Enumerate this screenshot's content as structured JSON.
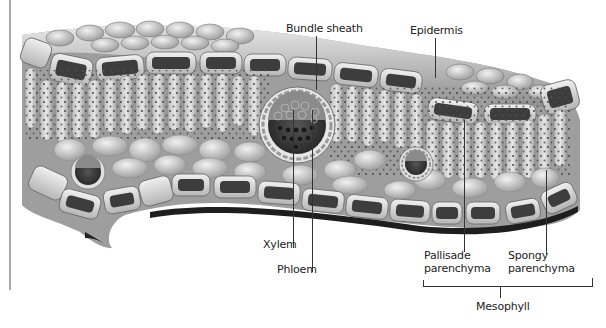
{
  "diagram": {
    "type": "anatomical-cross-section",
    "labels": {
      "bundle_sheath": "Bundle sheath",
      "epidermis": "Epidermis",
      "xylem": "Xylem",
      "phloem": "Phloem",
      "pallisade_line1": "Pallisade",
      "pallisade_line2": "parenchyma",
      "spongy_line1": "Spongy",
      "spongy_line2": "parenchyma",
      "mesophyll": "Mesophyll"
    },
    "colors": {
      "background": "#ffffff",
      "tissue_light": "#d9d9d9",
      "tissue_mid": "#a8a8a8",
      "tissue_dark": "#3a3a3a",
      "label_text": "#222222",
      "leader_line": "#333333"
    }
  }
}
